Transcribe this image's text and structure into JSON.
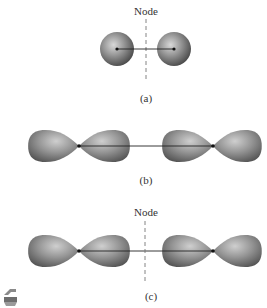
{
  "panels": [
    {
      "id": "a",
      "node_label": "Node",
      "caption": "(a)",
      "orbital_type": "s",
      "description": "two s orbitals with node between nuclei"
    },
    {
      "id": "b",
      "node_label": "",
      "caption": "(b)",
      "orbital_type": "p",
      "description": "two p orbitals end-on, no node"
    },
    {
      "id": "c",
      "node_label": "Node",
      "caption": "(c)",
      "orbital_type": "p",
      "description": "two p orbitals end-on with node between nuclei"
    }
  ],
  "icon": {
    "name": "page-corner-icon"
  },
  "colors": {
    "orbital_dark": "#5a5a5a",
    "orbital_light": "#c8c8c8",
    "line": "#222222",
    "dash": "#777777"
  }
}
